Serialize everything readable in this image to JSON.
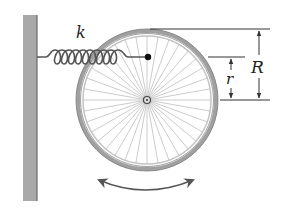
{
  "diagram": {
    "labels": {
      "spring_constant": "k",
      "outer_radius": "R",
      "attachment_radius": "r"
    },
    "colors": {
      "wall": "#a8a8a8",
      "wall_edge": "#6a6a6a",
      "spring": "#555555",
      "tire": "#9a9a9a",
      "rim": "#bdbdbd",
      "spokes": "#b0b0b0",
      "lines": "#333333"
    },
    "geometry": {
      "wheel_center": [
        147,
        100
      ],
      "outer_radius_px": 70,
      "attachment_point": [
        148,
        57
      ],
      "spoke_count": 36
    }
  }
}
